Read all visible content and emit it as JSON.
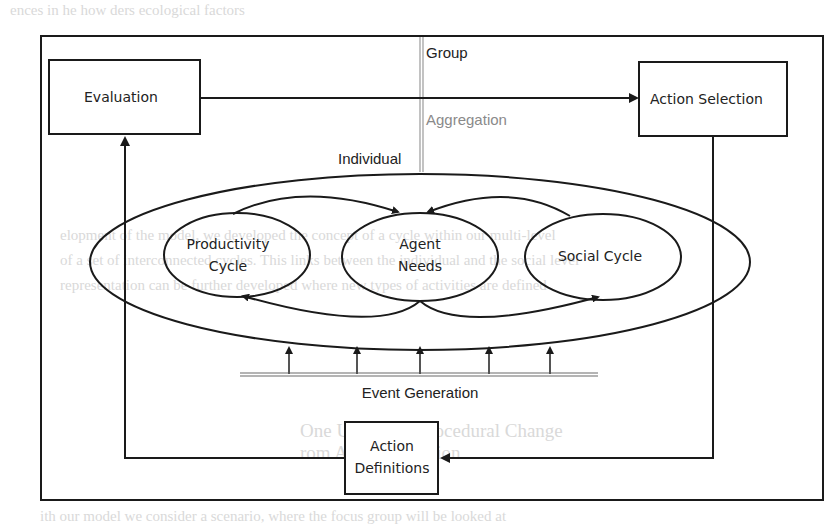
{
  "diagram": {
    "boxes": {
      "evaluation": "Evaluation",
      "action_selection": "Action Selection",
      "action_definitions_line1": "Action",
      "action_definitions_line2": "Definitions"
    },
    "levels": {
      "group": "Group",
      "aggregation": "Aggregation",
      "individual": "Individual"
    },
    "cycles": {
      "productivity_line1": "Productivity",
      "productivity_line2": "Cycle",
      "agent_needs_line1": "Agent",
      "agent_needs_line2": "Needs",
      "social": "Social Cycle"
    },
    "event_generation": "Event Generation",
    "event_arrow_count": 5,
    "colors": {
      "stroke": "#1a1a1a",
      "divider": "#9a9a9a",
      "aggregation_text": "#8a8a8a"
    }
  },
  "background_text": {
    "line1": "ences in      he                 how       ders                      ecological factors",
    "line2": "r with a sale.      How are individual     enriches social and societal influence",
    "line3": "        Feedback with groups?      complexity. People are both adaptively",
    "line4": "elopment of the model, we developed the concept of a cycle within our multi-level",
    "line5": "of a set of interconnected cycles. This links between the individual and the social level",
    "line6": "representation can be further developed where new types of activities are defined",
    "line7": "One Use Case: Procedural Change",
    "line8": "rom A: Consumption",
    "line9": "ith our model we consider a scenario, where the focus group will be looked at"
  }
}
